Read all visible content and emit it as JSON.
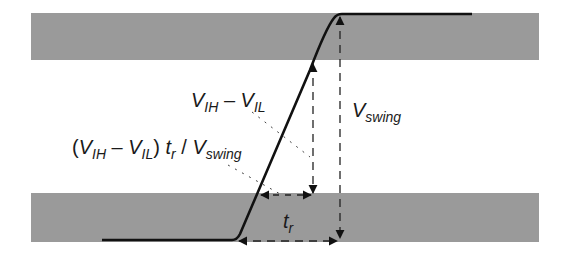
{
  "colors": {
    "band": "#9a9a9a",
    "signal": "#111111",
    "dashes": "#222222",
    "background": "#ffffff"
  },
  "labels": {
    "vih_vil": {
      "v1": "V",
      "s1": "IH",
      "minus": " – ",
      "v2": "V",
      "s2": "IL"
    },
    "vswing": {
      "v": "V",
      "s": "swing"
    },
    "formula": {
      "open": "(",
      "v1": "V",
      "s1": "IH",
      "minus": " – ",
      "v2": "V",
      "s2": "IL",
      "close": ")",
      "t": " t",
      "ts": "r",
      "slash": " / ",
      "v3": "V",
      "s3": "swing"
    },
    "tr": {
      "t": "t",
      "s": "r"
    }
  },
  "diagram": {
    "bands": [
      {
        "name": "high-region",
        "x": 31,
        "y": 13,
        "width": 508,
        "height": 47
      },
      {
        "name": "low-region",
        "x": 31,
        "y": 193,
        "width": 508,
        "height": 49
      }
    ]
  }
}
